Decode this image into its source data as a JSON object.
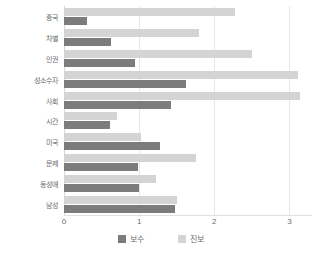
{
  "chart_data": {
    "type": "bar",
    "orientation": "horizontal",
    "title": "",
    "xlabel": "",
    "ylabel": "",
    "xlim": [
      0,
      3.3
    ],
    "xticks": [
      "0",
      "1",
      "2",
      "3"
    ],
    "xtick_values": [
      0,
      1,
      2,
      3
    ],
    "grid": true,
    "legend_position": "bottom",
    "categories": [
      "중국",
      "차별",
      "인권",
      "성소수자",
      "사회",
      "시간",
      "미국",
      "문제",
      "동성애",
      "남성"
    ],
    "series": [
      {
        "name": "진보",
        "color": "#d4d4d4",
        "values": [
          2.27,
          1.8,
          2.5,
          3.12,
          3.14,
          0.7,
          1.02,
          1.75,
          1.23,
          1.5
        ]
      },
      {
        "name": "보수",
        "color": "#7c7c7c",
        "values": [
          0.3,
          0.62,
          0.95,
          1.63,
          1.43,
          0.61,
          1.28,
          0.98,
          1.0,
          1.48
        ]
      }
    ]
  },
  "legend": {
    "items": [
      {
        "label": "보수",
        "color": "#7c7c7c"
      },
      {
        "label": "진보",
        "color": "#d4d4d4"
      }
    ]
  }
}
